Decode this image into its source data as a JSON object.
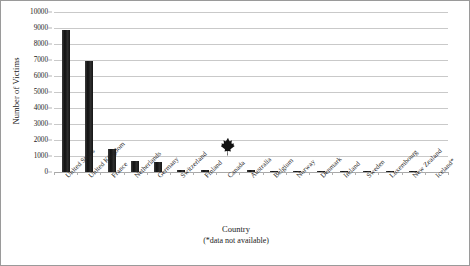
{
  "chart_data": {
    "type": "bar",
    "title": "",
    "xlabel": "Country",
    "xlabel_note": "(*data not available)",
    "ylabel": "Number of Victims",
    "ylim": [
      0,
      10000
    ],
    "ytick_step": 1000,
    "yticks": [
      "0",
      "1000",
      "2000",
      "3000",
      "4000",
      "5000",
      "6000",
      "7000",
      "8000",
      "9000",
      "10000"
    ],
    "grid": true,
    "legend": "none",
    "bar_color": "#1c1c1c",
    "categories": [
      "United States",
      "United Kingdom",
      "France",
      "Netherlands",
      "Germany",
      "Switzerland",
      "Finland",
      "Canada",
      "Australia",
      "Belgium",
      "Norway",
      "Denmark",
      "Ireland",
      "Sweden",
      "Luxembourg",
      "New Zealand",
      "Iceland*"
    ],
    "values": [
      8900,
      6950,
      1450,
      700,
      600,
      150,
      100,
      1200,
      95,
      90,
      85,
      80,
      75,
      70,
      60,
      55,
      null
    ],
    "annotations": [
      {
        "name": "maple-leaf-marker",
        "category": "Canada",
        "value": 1200,
        "icon": "maple-leaf-icon"
      }
    ]
  }
}
